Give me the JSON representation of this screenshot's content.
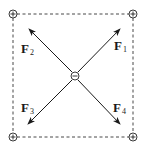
{
  "diagram": {
    "corner_charges": [
      {
        "position": "top-left",
        "sign": "+",
        "symbol": "⊕"
      },
      {
        "position": "top-right",
        "sign": "+",
        "symbol": "⊕"
      },
      {
        "position": "bottom-left",
        "sign": "+",
        "symbol": "⊕"
      },
      {
        "position": "bottom-right",
        "sign": "+",
        "symbol": "⊕"
      }
    ],
    "center_charge": {
      "sign": "−",
      "symbol": "⊖"
    },
    "forces": [
      {
        "name": "F",
        "sub": "1",
        "direction": "top-right"
      },
      {
        "name": "F",
        "sub": "2",
        "direction": "top-left"
      },
      {
        "name": "F",
        "sub": "3",
        "direction": "bottom-left"
      },
      {
        "name": "F",
        "sub": "4",
        "direction": "bottom-right"
      }
    ],
    "colors": {
      "line": "#1a1a1a",
      "dashed_border": "#333333",
      "background": "#ffffff"
    }
  }
}
